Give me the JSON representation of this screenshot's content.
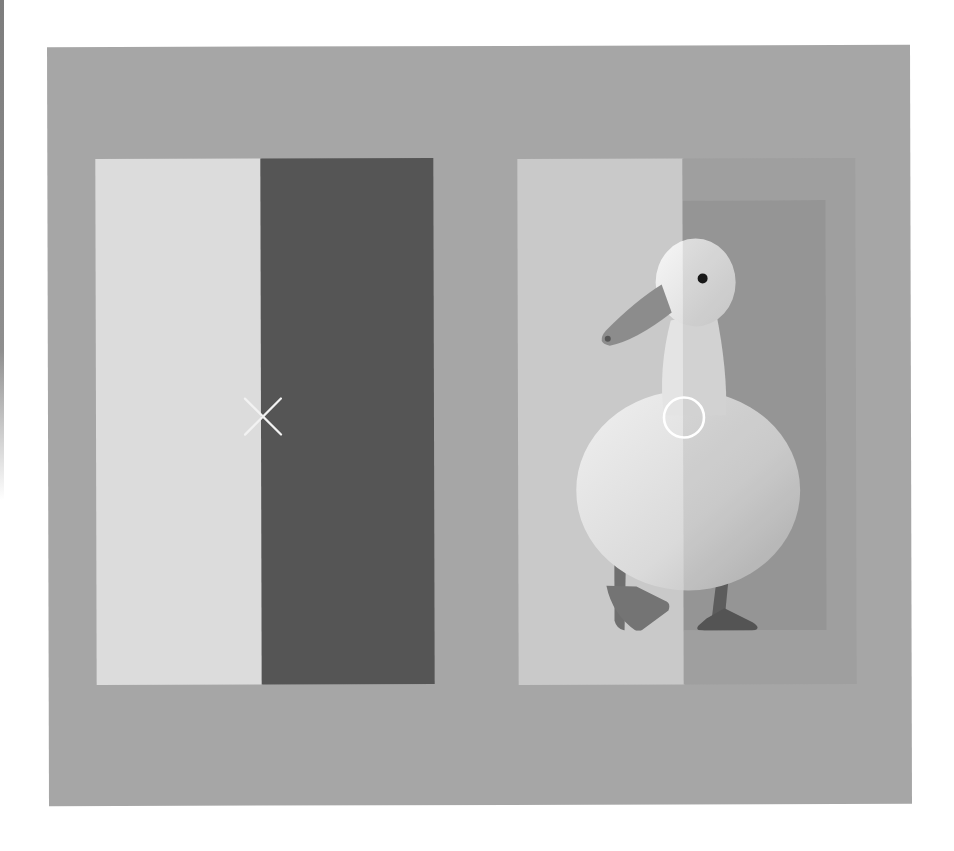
{
  "scene": {
    "description": "Brightness illusion demonstration: two side-by-side panels on a gray background",
    "background_color": "#a6a6a6",
    "page_color": "#ffffff",
    "left_panel": {
      "light_half_color": "#dcdcdc",
      "dark_half_color": "#555555",
      "marker": "x-mark",
      "marker_color": "#f2f2f2"
    },
    "right_panel": {
      "light_half_color": "#c9c9c9",
      "dark_half_color": "#9f9f9f",
      "subject": "white duck",
      "marker": "circle-mark",
      "marker_color": "#ffffff"
    }
  }
}
